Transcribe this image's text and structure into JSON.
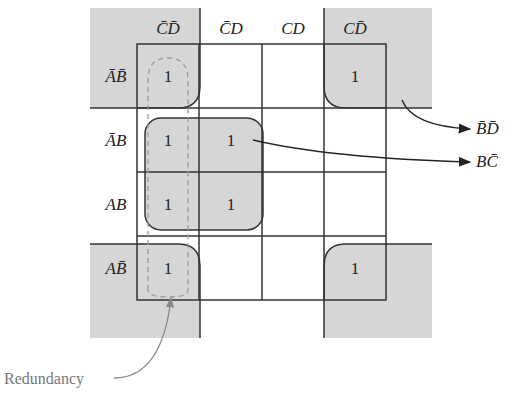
{
  "diagram": {
    "type": "karnaugh-map",
    "column_headers": [
      "C̄D̄",
      "C̄D",
      "CD",
      "CD̄"
    ],
    "row_headers": [
      "ĀB̄",
      "ĀB",
      "AB",
      "AB̄"
    ],
    "cells": [
      [
        "1",
        "",
        "",
        "1"
      ],
      [
        "1",
        "1",
        "",
        ""
      ],
      [
        "1",
        "1",
        "",
        ""
      ],
      [
        "1",
        "",
        "",
        "1"
      ]
    ],
    "groups": [
      {
        "name": "corners",
        "term": "B̄D̄"
      },
      {
        "name": "quad",
        "term": "BC̄"
      },
      {
        "name": "redundant-column",
        "term": "Redundancy"
      }
    ],
    "annotations": {
      "bd_label": "B̄D̄",
      "bc_label": "BC̄",
      "redundancy_label": "Redundancy"
    },
    "colors": {
      "group_fill": "#d6d6d6",
      "line": "#333333",
      "dashed": "#999999",
      "note_text": "#777777"
    }
  }
}
